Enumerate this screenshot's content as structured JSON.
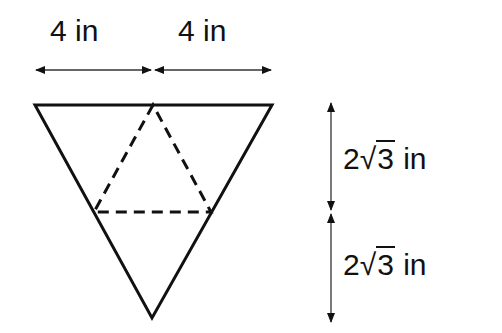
{
  "diagram": {
    "type": "geometry",
    "labels": {
      "top_left": "4 in",
      "top_right": "4 in",
      "side_upper": {
        "coef": "2",
        "radical": "√",
        "radicand": "3",
        "unit": "in"
      },
      "side_lower": {
        "coef": "2",
        "radical": "√",
        "radicand": "3",
        "unit": "in"
      }
    },
    "colors": {
      "stroke": "#111111",
      "background": "#ffffff"
    }
  }
}
